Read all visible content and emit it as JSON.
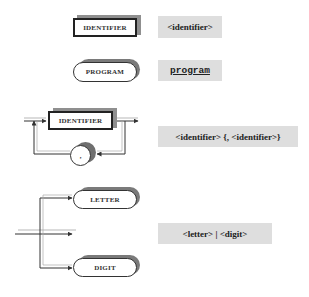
{
  "diagram": {
    "type": "syntax-diagram-to-ebnf-reference",
    "rows": [
      {
        "id": "nonterminal",
        "diagram": {
          "shape": "rectangle",
          "label": "IDENTIFIER"
        },
        "ebnf": "<identifier>"
      },
      {
        "id": "terminal",
        "diagram": {
          "shape": "rounded",
          "label": "PROGRAM"
        },
        "ebnf": "program"
      },
      {
        "id": "repetition",
        "diagram": {
          "shape": "rectangle-with-loop",
          "label": "IDENTIFIER",
          "loop_symbol": ","
        },
        "ebnf": "<identifier> {, <identifier>}"
      },
      {
        "id": "alternation",
        "diagram": {
          "shape": "branches",
          "options": [
            "LETTER",
            "DIGIT"
          ]
        },
        "ebnf": "<letter> | <digit>"
      }
    ],
    "colors": {
      "shadow": "#8f8f8f",
      "label_bg": "#dedede",
      "stroke": "#222222"
    }
  }
}
